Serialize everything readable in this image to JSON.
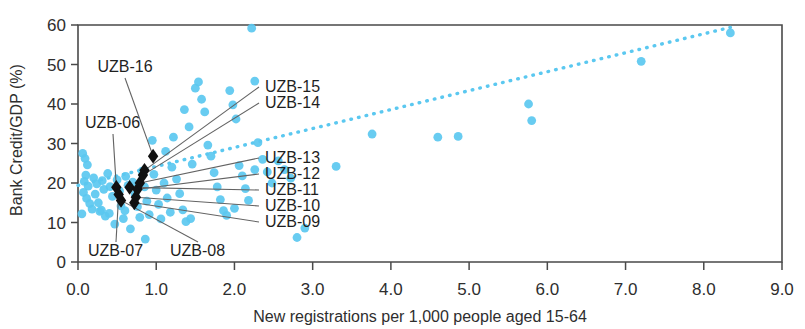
{
  "chart_data": {
    "type": "scatter",
    "title": "",
    "xlabel": "New registrations per 1,000 people aged 15-64",
    "ylabel": "Bank Credit/GDP (%)",
    "xlim": [
      0.0,
      9.0
    ],
    "ylim": [
      0,
      60
    ],
    "xticks": [
      "0.0",
      "1.0",
      "2.0",
      "3.0",
      "4.0",
      "5.0",
      "6.0",
      "7.0",
      "8.0",
      "9.0"
    ],
    "yticks": [
      "0",
      "10",
      "20",
      "30",
      "40",
      "50",
      "60"
    ],
    "grid": false,
    "legend": "none",
    "colors": {
      "points": "#5bc8f0",
      "highlight_points": "#111111",
      "trend_line": "#5bc8f0",
      "axis": "#4a4a4a",
      "leader_line": "#636363"
    },
    "series": [
      {
        "name": "Countries",
        "marker": "circle",
        "color": "#5bc8f0",
        "points": [
          [
            0.06,
            27.5
          ],
          [
            0.09,
            26.2
          ],
          [
            0.12,
            24.6
          ],
          [
            0.1,
            22.0
          ],
          [
            0.08,
            20.4
          ],
          [
            0.13,
            19.2
          ],
          [
            0.07,
            17.6
          ],
          [
            0.11,
            16.1
          ],
          [
            0.15,
            14.8
          ],
          [
            0.18,
            13.4
          ],
          [
            0.05,
            12.2
          ],
          [
            0.2,
            21.3
          ],
          [
            0.24,
            19.8
          ],
          [
            0.22,
            17.2
          ],
          [
            0.26,
            15.0
          ],
          [
            0.28,
            12.8
          ],
          [
            0.31,
            20.6
          ],
          [
            0.33,
            18.4
          ],
          [
            0.3,
            13.1
          ],
          [
            0.35,
            11.6
          ],
          [
            0.38,
            22.4
          ],
          [
            0.41,
            19.1
          ],
          [
            0.44,
            16.6
          ],
          [
            0.4,
            12.3
          ],
          [
            0.47,
            9.6
          ],
          [
            0.5,
            20.8
          ],
          [
            0.53,
            18.0
          ],
          [
            0.55,
            14.2
          ],
          [
            0.58,
            11.0
          ],
          [
            0.61,
            21.7
          ],
          [
            0.64,
            19.4
          ],
          [
            0.6,
            13.0
          ],
          [
            0.67,
            8.4
          ],
          [
            0.7,
            20.2
          ],
          [
            0.73,
            17.1
          ],
          [
            0.76,
            14.0
          ],
          [
            0.79,
            11.3
          ],
          [
            0.82,
            23.0
          ],
          [
            0.85,
            19.0
          ],
          [
            0.88,
            15.4
          ],
          [
            0.91,
            12.0
          ],
          [
            0.95,
            30.8
          ],
          [
            0.97,
            22.2
          ],
          [
            1.0,
            18.2
          ],
          [
            1.03,
            14.6
          ],
          [
            1.06,
            10.9
          ],
          [
            1.1,
            20.0
          ],
          [
            1.14,
            16.2
          ],
          [
            1.18,
            12.6
          ],
          [
            1.22,
            31.6
          ],
          [
            1.26,
            21.0
          ],
          [
            1.3,
            17.3
          ],
          [
            1.34,
            13.2
          ],
          [
            1.38,
            10.2
          ],
          [
            1.42,
            34.2
          ],
          [
            1.46,
            24.8
          ],
          [
            1.5,
            44.0
          ],
          [
            1.54,
            45.6
          ],
          [
            1.58,
            41.2
          ],
          [
            1.62,
            38.0
          ],
          [
            1.66,
            29.6
          ],
          [
            1.7,
            26.8
          ],
          [
            1.74,
            22.6
          ],
          [
            1.78,
            19.0
          ],
          [
            1.82,
            15.8
          ],
          [
            1.86,
            13.0
          ],
          [
            1.9,
            11.8
          ],
          [
            1.94,
            43.4
          ],
          [
            1.98,
            39.8
          ],
          [
            2.02,
            36.2
          ],
          [
            2.06,
            24.4
          ],
          [
            2.1,
            21.8
          ],
          [
            2.14,
            18.6
          ],
          [
            2.18,
            15.6
          ],
          [
            2.22,
            59.2
          ],
          [
            2.26,
            45.8
          ],
          [
            2.3,
            30.2
          ],
          [
            2.36,
            26.0
          ],
          [
            2.42,
            22.8
          ],
          [
            2.48,
            20.0
          ],
          [
            2.56,
            25.6
          ],
          [
            2.64,
            23.4
          ],
          [
            2.72,
            21.2
          ],
          [
            2.8,
            6.2
          ],
          [
            2.9,
            8.6
          ],
          [
            1.36,
            38.6
          ],
          [
            1.12,
            28.0
          ],
          [
            0.86,
            5.8
          ],
          [
            1.44,
            11.0
          ],
          [
            2.0,
            13.6
          ],
          [
            3.76,
            32.4
          ],
          [
            4.86,
            31.8
          ],
          [
            4.6,
            31.6
          ],
          [
            5.76,
            40.0
          ],
          [
            5.8,
            35.8
          ],
          [
            7.2,
            50.8
          ],
          [
            8.34,
            58.0
          ],
          [
            3.3,
            24.2
          ],
          [
            2.26,
            23.4
          ],
          [
            1.2,
            24.0
          ]
        ]
      },
      {
        "name": "Uzbekistan (UZB) by year",
        "marker": "diamond",
        "color": "#111111",
        "points": [
          {
            "label": "UZB-06",
            "x": 0.49,
            "y": 18.9
          },
          {
            "label": "UZB-07",
            "x": 0.52,
            "y": 17.1
          },
          {
            "label": "UZB-08",
            "x": 0.55,
            "y": 15.6
          },
          {
            "label": "UZB-09",
            "x": 0.72,
            "y": 15.0
          },
          {
            "label": "UZB-10",
            "x": 0.74,
            "y": 16.4
          },
          {
            "label": "UZB-11",
            "x": 0.66,
            "y": 18.9
          },
          {
            "label": "UZB-12",
            "x": 0.76,
            "y": 18.4
          },
          {
            "label": "UZB-13",
            "x": 0.79,
            "y": 20.0
          },
          {
            "label": "UZB-14",
            "x": 0.83,
            "y": 22.0
          },
          {
            "label": "UZB-15",
            "x": 0.85,
            "y": 23.2
          },
          {
            "label": "UZB-16",
            "x": 0.96,
            "y": 26.8
          }
        ]
      }
    ],
    "trend_line": {
      "style": "dotted",
      "color": "#5bc8f0",
      "x_start": 0.0,
      "y_start": 19.4,
      "x_end": 8.34,
      "y_end": 59.4
    },
    "annotations": [
      {
        "label": "UZB-16",
        "text_x": 125,
        "text_y": 72,
        "anchor": "middle",
        "target": "UZB-16"
      },
      {
        "label": "UZB-06",
        "text_x": 85,
        "text_y": 128,
        "anchor": "start",
        "target": "UZB-06"
      },
      {
        "label": "UZB-15",
        "text_x": 265,
        "text_y": 92,
        "anchor": "start",
        "target": "UZB-15"
      },
      {
        "label": "UZB-14",
        "text_x": 265,
        "text_y": 108,
        "anchor": "start",
        "target": "UZB-14"
      },
      {
        "label": "UZB-13",
        "text_x": 265,
        "text_y": 163,
        "anchor": "start",
        "target": "UZB-13"
      },
      {
        "label": "UZB-12",
        "text_x": 265,
        "text_y": 179,
        "anchor": "start",
        "target": "UZB-12"
      },
      {
        "label": "UZB-11",
        "text_x": 265,
        "text_y": 195,
        "anchor": "start",
        "target": "UZB-11"
      },
      {
        "label": "UZB-10",
        "text_x": 265,
        "text_y": 211,
        "anchor": "start",
        "target": "UZB-10"
      },
      {
        "label": "UZB-09",
        "text_x": 265,
        "text_y": 227,
        "anchor": "start",
        "target": "UZB-09"
      },
      {
        "label": "UZB-07",
        "text_x": 88,
        "text_y": 256,
        "anchor": "start",
        "target": "UZB-07"
      },
      {
        "label": "UZB-08",
        "text_x": 170,
        "text_y": 256,
        "anchor": "start",
        "target": "UZB-08"
      }
    ]
  }
}
